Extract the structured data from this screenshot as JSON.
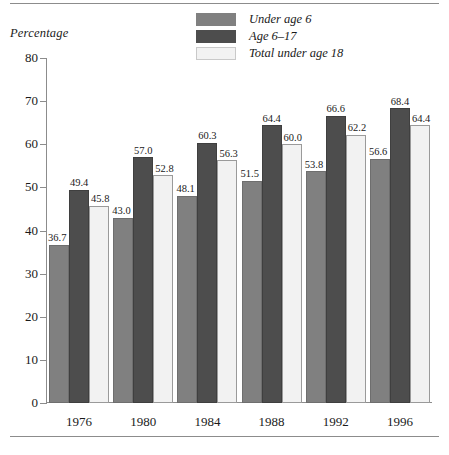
{
  "chart_data": {
    "type": "bar",
    "title": "",
    "xlabel": "",
    "ylabel": "Percentage",
    "ylim": [
      0,
      80
    ],
    "yticks": [
      0,
      10,
      20,
      30,
      40,
      50,
      60,
      70,
      80
    ],
    "ytick_labels": [
      "0",
      "10",
      "20",
      "30",
      "40",
      "50",
      "60",
      "70",
      "80"
    ],
    "grid": false,
    "legend_position": "top-center",
    "categories": [
      "1976",
      "1980",
      "1984",
      "1988",
      "1992",
      "1996"
    ],
    "series": [
      {
        "name": "Under age 6",
        "color": "#808080",
        "values": [
          36.7,
          43.0,
          48.1,
          51.5,
          53.8,
          56.6
        ],
        "labels": [
          "36.7",
          "43.0",
          "48.1",
          "51.5",
          "53.8",
          "56.6"
        ]
      },
      {
        "name": "Age 6–17",
        "color": "#4d4d4d",
        "values": [
          49.4,
          57.0,
          60.3,
          64.4,
          66.6,
          68.4
        ],
        "labels": [
          "49.4",
          "57.0",
          "60.3",
          "64.4",
          "66.6",
          "68.4"
        ]
      },
      {
        "name": "Total under age 18",
        "color": "#f2f2f2",
        "values": [
          45.8,
          52.8,
          56.3,
          60.0,
          62.2,
          64.4
        ],
        "labels": [
          "45.8",
          "52.8",
          "56.3",
          "60.0",
          "62.2",
          "64.4"
        ]
      }
    ]
  },
  "axis": {
    "y_title": "Percentage"
  },
  "legend": {
    "items": [
      {
        "label": "Under age 6"
      },
      {
        "label": "Age 6–17"
      },
      {
        "label": "Total under age 18"
      }
    ]
  },
  "colors": {
    "series_under_6": "#808080",
    "series_6_17": "#4d4d4d",
    "series_total_18": "#f2f2f2",
    "axis": "#8c8c8c",
    "text": "#1a1a1a",
    "background": "#ffffff"
  }
}
